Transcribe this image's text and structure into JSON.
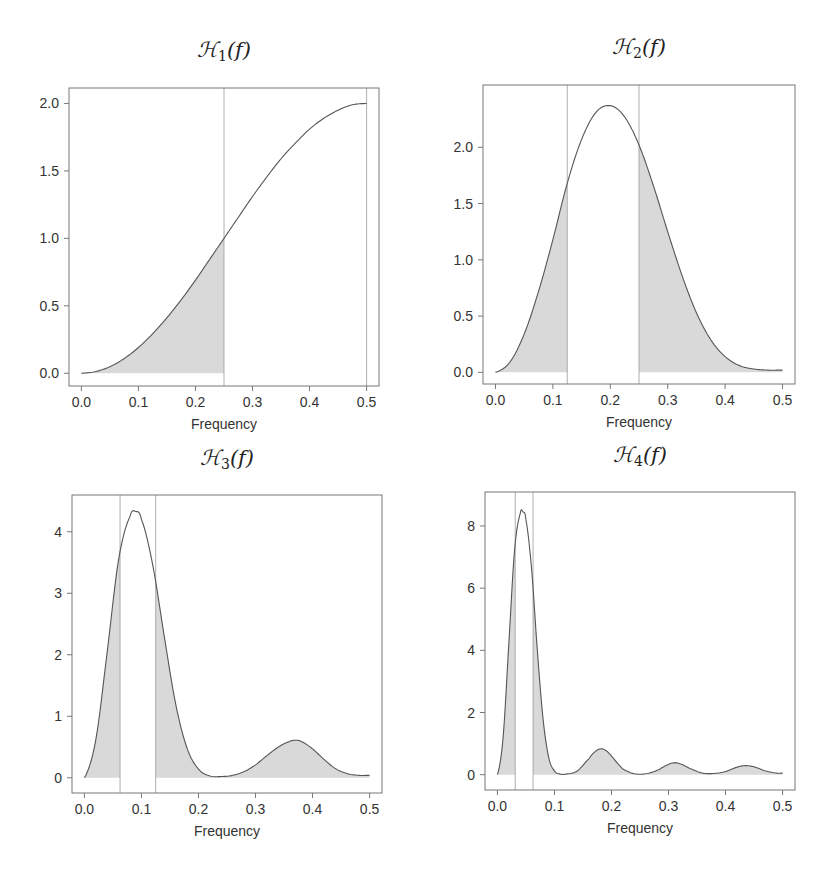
{
  "figure": {
    "colors": {
      "curve": "#555555",
      "fill": "#d9d9d9",
      "frame": "#777777",
      "guide": "#999999",
      "text": "#333333"
    }
  },
  "chart_data": [
    {
      "type": "area",
      "title": "H1(f)",
      "title_script": "H",
      "title_sub": "1",
      "title_arg": "(f)",
      "xlabel": "Frequency",
      "ylabel": "",
      "xlim": [
        0.0,
        0.5
      ],
      "ylim": [
        -0.05,
        2.07
      ],
      "xticks": [
        "0.0",
        "0.1",
        "0.2",
        "0.3",
        "0.4",
        "0.5"
      ],
      "yticks": [
        0.0,
        0.5,
        1.0,
        1.5,
        2.0
      ],
      "ytick_labels": [
        "0.0",
        "0.5",
        "1.0",
        "1.5",
        "2.0"
      ],
      "vertical_lines": [
        0.25,
        0.5
      ],
      "shaded_intervals": [
        [
          0.0,
          0.25
        ]
      ],
      "grid": false,
      "frame_px": {
        "left": 69,
        "top": 88,
        "right": 379,
        "bottom": 386
      },
      "x": [
        0.0,
        0.025,
        0.05,
        0.075,
        0.1,
        0.125,
        0.15,
        0.175,
        0.2,
        0.225,
        0.25,
        0.275,
        0.3,
        0.325,
        0.35,
        0.375,
        0.4,
        0.425,
        0.45,
        0.475,
        0.5
      ],
      "values": [
        0.0,
        0.025,
        0.098,
        0.218,
        0.382,
        0.586,
        0.824,
        1.09,
        1.38,
        1.69,
        2.0,
        2.31,
        2.62,
        2.91,
        3.18,
        3.41,
        3.62,
        3.78,
        3.9,
        3.98,
        4.0
      ],
      "value_scale": 0.5,
      "peak": {
        "x": 0.5,
        "y": 2.0
      }
    },
    {
      "type": "area",
      "title": "H2(f)",
      "title_script": "H",
      "title_sub": "2",
      "title_arg": "(f)",
      "xlabel": "Frequency",
      "ylabel": "",
      "xlim": [
        0.0,
        0.5
      ],
      "ylim": [
        -0.05,
        2.5
      ],
      "xticks": [
        "0.0",
        "0.1",
        "0.2",
        "0.3",
        "0.4",
        "0.5"
      ],
      "yticks": [
        0.0,
        0.5,
        1.0,
        1.5,
        2.0
      ],
      "ytick_labels": [
        "0.0",
        "0.5",
        "1.0",
        "1.5",
        "2.0"
      ],
      "vertical_lines": [
        0.125,
        0.25
      ],
      "shaded_intervals": [
        [
          0.0,
          0.125
        ],
        [
          0.25,
          0.5
        ]
      ],
      "grid": false,
      "frame_px": {
        "left": 483,
        "top": 85,
        "right": 795,
        "bottom": 384
      },
      "x": [
        0.0,
        0.025,
        0.05,
        0.075,
        0.1,
        0.125,
        0.15,
        0.175,
        0.2,
        0.225,
        0.25,
        0.275,
        0.3,
        0.325,
        0.35,
        0.375,
        0.4,
        0.425,
        0.45,
        0.475,
        0.5
      ],
      "values": [
        0.0,
        0.09,
        0.34,
        0.72,
        1.18,
        1.68,
        2.07,
        2.31,
        2.37,
        2.27,
        2.02,
        1.66,
        1.25,
        0.86,
        0.53,
        0.29,
        0.14,
        0.06,
        0.03,
        0.02,
        0.02
      ],
      "value_scale": 1,
      "peak": {
        "x": 0.195,
        "y": 2.37
      }
    },
    {
      "type": "area",
      "title": "H3(f)",
      "title_script": "H",
      "title_sub": "3",
      "title_arg": "(f)",
      "xlabel": "Frequency",
      "ylabel": "",
      "xlim": [
        0.0,
        0.5
      ],
      "ylim": [
        -0.15,
        4.5
      ],
      "xticks": [
        "0.0",
        "0.1",
        "0.2",
        "0.3",
        "0.4",
        "0.5"
      ],
      "yticks": [
        0,
        1,
        2,
        3,
        4
      ],
      "ytick_labels": [
        "0",
        "1",
        "2",
        "3",
        "4"
      ],
      "vertical_lines": [
        0.0625,
        0.125
      ],
      "shaded_intervals": [
        [
          0.0,
          0.0625
        ],
        [
          0.125,
          0.5
        ]
      ],
      "grid": false,
      "frame_px": {
        "left": 72,
        "top": 495,
        "right": 382,
        "bottom": 793
      },
      "x": [
        0.0,
        0.02,
        0.04,
        0.06,
        0.08,
        0.09,
        0.1,
        0.12,
        0.14,
        0.16,
        0.18,
        0.2,
        0.22,
        0.24,
        0.26,
        0.28,
        0.3,
        0.32,
        0.34,
        0.36,
        0.37,
        0.38,
        0.4,
        0.42,
        0.44,
        0.46,
        0.48,
        0.5
      ],
      "values": [
        0.0,
        0.62,
        2.05,
        3.55,
        4.25,
        4.33,
        4.2,
        3.45,
        2.3,
        1.2,
        0.48,
        0.14,
        0.03,
        0.02,
        0.04,
        0.1,
        0.21,
        0.36,
        0.5,
        0.59,
        0.61,
        0.59,
        0.47,
        0.3,
        0.15,
        0.07,
        0.04,
        0.04
      ],
      "value_scale": 1,
      "peak": {
        "x": 0.09,
        "y": 4.33
      },
      "secondary_peak": {
        "x": 0.37,
        "y": 0.61
      }
    },
    {
      "type": "area",
      "title": "H4(f)",
      "title_script": "H",
      "title_sub": "4",
      "title_arg": "(f)",
      "xlabel": "Frequency",
      "ylabel": "",
      "xlim": [
        0.0,
        0.5
      ],
      "ylim": [
        -0.3,
        8.9
      ],
      "xticks": [
        "0.0",
        "0.1",
        "0.2",
        "0.3",
        "0.4",
        "0.5"
      ],
      "yticks": [
        0,
        2,
        4,
        6,
        8
      ],
      "ytick_labels": [
        "0",
        "2",
        "4",
        "6",
        "8"
      ],
      "vertical_lines": [
        0.03125,
        0.0625
      ],
      "shaded_intervals": [
        [
          0.0,
          0.03125
        ],
        [
          0.0625,
          0.5
        ]
      ],
      "grid": false,
      "frame_px": {
        "left": 485,
        "top": 492,
        "right": 795,
        "bottom": 790
      },
      "x": [
        0.0,
        0.01,
        0.02,
        0.03,
        0.04,
        0.045,
        0.05,
        0.06,
        0.07,
        0.08,
        0.09,
        0.1,
        0.11,
        0.12,
        0.14,
        0.16,
        0.17,
        0.18,
        0.19,
        0.2,
        0.21,
        0.22,
        0.24,
        0.26,
        0.28,
        0.3,
        0.31,
        0.32,
        0.34,
        0.36,
        0.38,
        0.4,
        0.42,
        0.435,
        0.45,
        0.47,
        0.49,
        0.5
      ],
      "values": [
        0.0,
        1.2,
        4.2,
        7.2,
        8.4,
        8.45,
        8.2,
        6.6,
        4.0,
        1.8,
        0.55,
        0.12,
        0.02,
        0.02,
        0.12,
        0.5,
        0.72,
        0.83,
        0.78,
        0.6,
        0.38,
        0.18,
        0.03,
        0.03,
        0.14,
        0.33,
        0.38,
        0.35,
        0.18,
        0.05,
        0.04,
        0.1,
        0.24,
        0.29,
        0.25,
        0.12,
        0.05,
        0.05
      ],
      "value_scale": 1,
      "peak": {
        "x": 0.045,
        "y": 8.45
      },
      "secondary_peaks": [
        {
          "x": 0.18,
          "y": 0.83
        },
        {
          "x": 0.31,
          "y": 0.38
        },
        {
          "x": 0.435,
          "y": 0.29
        }
      ]
    }
  ]
}
